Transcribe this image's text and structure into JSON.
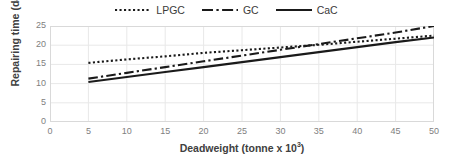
{
  "chart_data": {
    "type": "line",
    "title": "",
    "xlabel": "Deadweight (tonne x 10³)",
    "xlabel_base": "Deadweight (tonne x 10",
    "xlabel_exp": "3",
    "xlabel_tail": ")",
    "ylabel": "Repairing time (day)",
    "xlim": [
      0,
      50
    ],
    "ylim": [
      0,
      25
    ],
    "xticks": [
      0,
      5,
      10,
      15,
      20,
      25,
      30,
      35,
      40,
      45,
      50
    ],
    "yticks": [
      0,
      5,
      10,
      15,
      20,
      25
    ],
    "grid": true,
    "legend_position": "top-center",
    "x": [
      5,
      10,
      15,
      20,
      25,
      30,
      35,
      40,
      45,
      50
    ],
    "series": [
      {
        "name": "LPGC",
        "style": "dotted",
        "color": "#1a1a1a",
        "values": [
          15.4,
          16.3,
          17.1,
          18.0,
          18.7,
          19.4,
          20.1,
          20.9,
          21.7,
          22.5
        ]
      },
      {
        "name": "GC",
        "style": "dash-dot",
        "color": "#1a1a1a",
        "values": [
          11.3,
          12.8,
          14.3,
          15.8,
          17.3,
          18.8,
          20.3,
          21.8,
          23.3,
          25.0
        ]
      },
      {
        "name": "CaC",
        "style": "solid",
        "color": "#1a1a1a",
        "values": [
          10.4,
          11.7,
          13.0,
          14.3,
          15.6,
          16.9,
          18.2,
          19.5,
          20.8,
          22.0
        ]
      }
    ],
    "axis_color": "#d9d9d9",
    "grid_color": "#e8e8e8",
    "tick_label_color": "#808080",
    "axis_title_color": "#404040"
  },
  "legend": {
    "items": [
      {
        "label": "LPGC",
        "key": "dotted-line-key"
      },
      {
        "label": "GC",
        "key": "dash-dot-line-key"
      },
      {
        "label": "CaC",
        "key": "solid-line-key"
      }
    ]
  }
}
